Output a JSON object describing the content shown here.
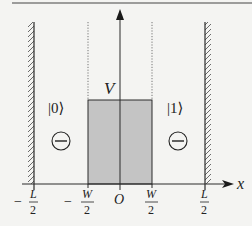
{
  "diagram": {
    "type": "potential-well",
    "colors": {
      "background": "#f4f4f2",
      "line": "#2a2a2a",
      "barrier_fill": "#c4c4c4",
      "hatch": "#555555",
      "dotted": "#666666"
    },
    "axes": {
      "x_label": "x",
      "y_label": "V",
      "origin_label": "O"
    },
    "ticks": [
      {
        "id": "minus-L-half",
        "sign": "−",
        "num": "L",
        "den": "2"
      },
      {
        "id": "minus-W-half",
        "sign": "−",
        "num": "W",
        "den": "2"
      },
      {
        "id": "origin",
        "sign": "",
        "num": "O",
        "den": ""
      },
      {
        "id": "W-half",
        "sign": "",
        "num": "W",
        "den": "2"
      },
      {
        "id": "L-half",
        "sign": "",
        "num": "L",
        "den": "2"
      }
    ],
    "states": [
      {
        "id": "left",
        "ket": "|0⟩",
        "charge": "⊖"
      },
      {
        "id": "right",
        "ket": "|1⟩",
        "charge": "⊖"
      }
    ],
    "barrier_label": "V"
  }
}
